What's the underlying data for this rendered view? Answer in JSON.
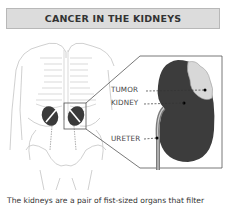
{
  "header": {
    "title": "CANCER IN THE KIDNEYS"
  },
  "figure": {
    "labels": {
      "tumor": "TUMOR",
      "kidney": "KIDNEY",
      "ureter": "URETER"
    },
    "colors": {
      "kidney": "#3a3a3a",
      "tumor": "#d8d8d8",
      "outline": "#c4c4c4",
      "callout": "#555555"
    }
  },
  "caption": {
    "text": "The kidneys are a pair of fist-sized organs that filter"
  }
}
